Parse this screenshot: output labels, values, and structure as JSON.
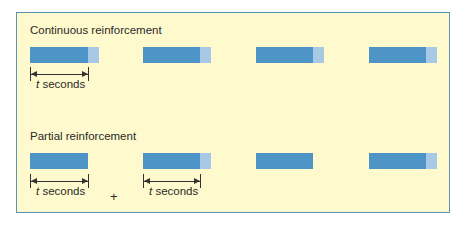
{
  "colors": {
    "background": "#fffacd",
    "border": "#5b93b0",
    "response_bar": "#4f94c6",
    "reinforcement": "#a7c9e6"
  },
  "continuous": {
    "title": "Continuous reinforcement",
    "bars": [
      {
        "x": 30,
        "dark_width": 58,
        "light_width": 11,
        "reinforced": true
      },
      {
        "x": 143,
        "dark_width": 57,
        "light_width": 11,
        "reinforced": true
      },
      {
        "x": 256,
        "dark_width": 57,
        "light_width": 11,
        "reinforced": true
      },
      {
        "x": 369,
        "dark_width": 57,
        "light_width": 11,
        "reinforced": true
      }
    ],
    "intervals": [
      {
        "var": "t",
        "unit": "seconds"
      }
    ]
  },
  "partial": {
    "title": "Partial reinforcement",
    "bars": [
      {
        "x": 30,
        "dark_width": 58,
        "light_width": 0,
        "reinforced": false
      },
      {
        "x": 143,
        "dark_width": 57,
        "light_width": 11,
        "reinforced": true
      },
      {
        "x": 256,
        "dark_width": 57,
        "light_width": 0,
        "reinforced": false
      },
      {
        "x": 369,
        "dark_width": 57,
        "light_width": 11,
        "reinforced": true
      }
    ],
    "intervals": [
      {
        "var": "t",
        "unit": "seconds"
      },
      {
        "var": "t",
        "unit": "seconds"
      }
    ],
    "operator": "+"
  }
}
